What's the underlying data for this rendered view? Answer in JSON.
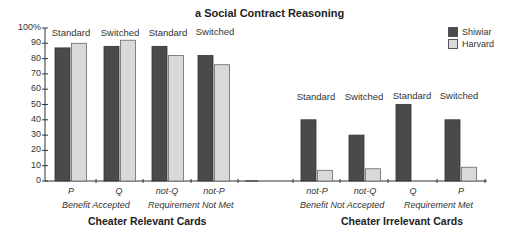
{
  "title": "a  Social Contract Reasoning",
  "legend": [
    {
      "name": "Shiwiar",
      "color": "#4a4a4a"
    },
    {
      "name": "Harvard",
      "color": "#d9d9d9"
    }
  ],
  "y_axis": {
    "ticks": [
      "0",
      "10",
      "20",
      "30",
      "40",
      "50",
      "60",
      "70",
      "80",
      "90",
      "100%"
    ]
  },
  "left_panel": {
    "section_label": "Cheater Relevant Cards",
    "condition_labels": [
      "Standard",
      "Switched",
      "Standard",
      "Switched"
    ],
    "card_labels": [
      "P",
      "Q",
      "not-Q",
      "not-P"
    ],
    "group_labels": [
      "Benefit Accepted",
      "Requirement Not Met"
    ]
  },
  "right_panel": {
    "section_label": "Cheater Irrelevant Cards",
    "condition_labels": [
      "Standard",
      "Switched",
      "Standard",
      "Switched"
    ],
    "card_labels": [
      "not-P",
      "not-Q",
      "Q",
      "P"
    ],
    "group_labels": [
      "Benefit Not Accepted",
      "Requirement Met"
    ]
  },
  "chart_data": {
    "type": "bar",
    "title": "a  Social Contract Reasoning",
    "ylabel": "",
    "ylim": [
      0,
      100
    ],
    "y_ticks": [
      0,
      10,
      20,
      30,
      40,
      50,
      60,
      70,
      80,
      90,
      100
    ],
    "grid": false,
    "legend_position": "top-right",
    "categories": [
      "P (Standard)",
      "Q (Switched)",
      "not-Q (Standard)",
      "not-P (Switched)",
      "not-P (Standard)",
      "not-Q (Switched)",
      "Q (Standard)",
      "P (Switched)"
    ],
    "panels": [
      {
        "label": "Cheater Relevant Cards",
        "cards": [
          "P",
          "Q",
          "not-Q",
          "not-P"
        ],
        "conditions": [
          "Standard",
          "Switched",
          "Standard",
          "Switched"
        ],
        "groups": [
          "Benefit Accepted",
          "Requirement Not Met"
        ]
      },
      {
        "label": "Cheater Irrelevant Cards",
        "cards": [
          "not-P",
          "not-Q",
          "Q",
          "P"
        ],
        "conditions": [
          "Standard",
          "Switched",
          "Standard",
          "Switched"
        ],
        "groups": [
          "Benefit Not Accepted",
          "Requirement Met"
        ]
      }
    ],
    "series": [
      {
        "name": "Shiwiar",
        "color": "#4a4a4a",
        "values": [
          87,
          88,
          88,
          82,
          40,
          30,
          50,
          40
        ]
      },
      {
        "name": "Harvard",
        "color": "#d9d9d9",
        "values": [
          90,
          92,
          82,
          76,
          7,
          8,
          0,
          9
        ]
      }
    ]
  }
}
